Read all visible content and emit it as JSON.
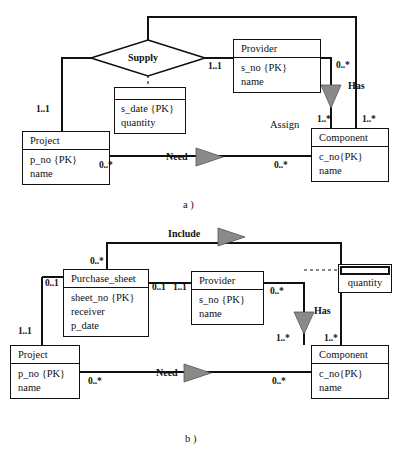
{
  "figure": {
    "caption_a": "a )",
    "caption_b": "b )"
  },
  "diagram_a": {
    "entities": [
      {
        "id": "provider",
        "title": "Provider",
        "attributes": [
          "s_no {PK}",
          "name"
        ]
      },
      {
        "id": "project",
        "title": "Project",
        "attributes": [
          "p_no {PK}",
          "name"
        ]
      },
      {
        "id": "component",
        "title": "Component",
        "attributes": [
          "c_no{PK}",
          "name"
        ]
      }
    ],
    "attribute_box": {
      "id": "supply-attributes",
      "attributes": [
        "s_date {PK}",
        "quantity"
      ]
    },
    "relationships": {
      "supply": "Supply",
      "has": "Has",
      "need": "Need",
      "assign": "Assign"
    },
    "cardinalities": {
      "supply_provider": "1..1",
      "supply_project": "1..1",
      "provider_has": "0..*",
      "has_component": "1..*",
      "component_assign": "1..*",
      "project_need": "0..*",
      "component_need": "0..*"
    }
  },
  "diagram_b": {
    "entities": [
      {
        "id": "purchase-sheet",
        "title": "Purchase_sheet",
        "attributes": [
          "sheet_no {PK}",
          "receiver",
          "p_date"
        ]
      },
      {
        "id": "provider",
        "title": "Provider",
        "attributes": [
          "s_no {PK}",
          "name"
        ]
      },
      {
        "id": "project",
        "title": "Project",
        "attributes": [
          "p_no {PK}",
          "name"
        ]
      },
      {
        "id": "component",
        "title": "Component",
        "attributes": [
          "c_no{PK}",
          "name"
        ]
      }
    ],
    "quantity_box": {
      "id": "quantity",
      "label": "quantity"
    },
    "relationships": {
      "include": "Include",
      "has": "Has",
      "need": "Need"
    },
    "cardinalities": {
      "sheet_include": "0..*",
      "sheet_project_top": "0..1",
      "sheet_provider": "0..1",
      "provider_sheet": "1..1",
      "project_sheet": "1..1",
      "provider_has": "0..*",
      "has_component": "1..*",
      "component_include": "1..*",
      "project_need": "0..*",
      "component_need": "0..*"
    }
  },
  "colors": {
    "line": "#111111",
    "triangle_fill": "#8a8a8a",
    "background": "#ffffff"
  }
}
